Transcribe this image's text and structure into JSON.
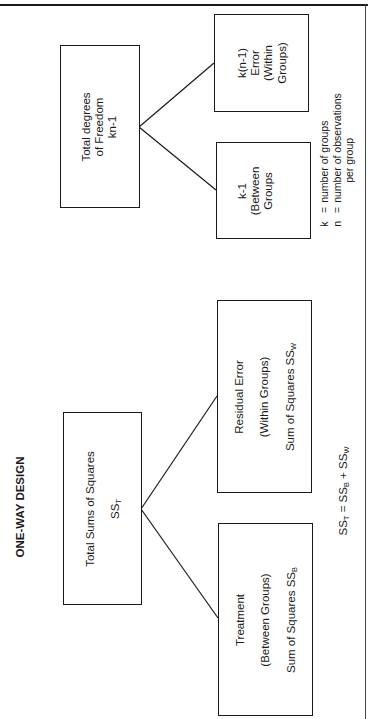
{
  "diagram": {
    "title": "ONE-WAY DESIGN",
    "sums_of_squares": {
      "total": {
        "line1": "Total Sums of Squares",
        "line2": "SS",
        "line2_sub": "T"
      },
      "treatment": {
        "line1": "Treatment",
        "line2": "(Between Groups)",
        "line3": "Sum of Squares SS",
        "line3_sub": "B"
      },
      "residual": {
        "line1": "Residual Error",
        "line2": "(Within Groups)",
        "line3": "Sum of Squares SS",
        "line3_sub": "W"
      },
      "equation": {
        "lhs": "SS",
        "lhs_sub": "T",
        "eq": " = ",
        "t1": "SS",
        "t1_sub": "B",
        "plus": " + ",
        "t2": "SS",
        "t2_sub": "W"
      }
    },
    "degrees_of_freedom": {
      "total": {
        "line1": "Total degrees",
        "line2": "of Freedom",
        "line3": "kn-1"
      },
      "between": {
        "line1": "k-1",
        "line2": "(Between",
        "line3": "Groups"
      },
      "within": {
        "line1": "k(n-1)",
        "line2": "Error",
        "line3": "(Within",
        "line4": "Groups)"
      }
    },
    "legend": [
      {
        "symbol": "k",
        "eq": "=",
        "text": "number of groups"
      },
      {
        "symbol": "n",
        "eq": "=",
        "text": "number of observations"
      },
      {
        "continuation": "per group"
      }
    ],
    "colors": {
      "ink": "#1a1a1a",
      "background": "#ffffff"
    }
  }
}
